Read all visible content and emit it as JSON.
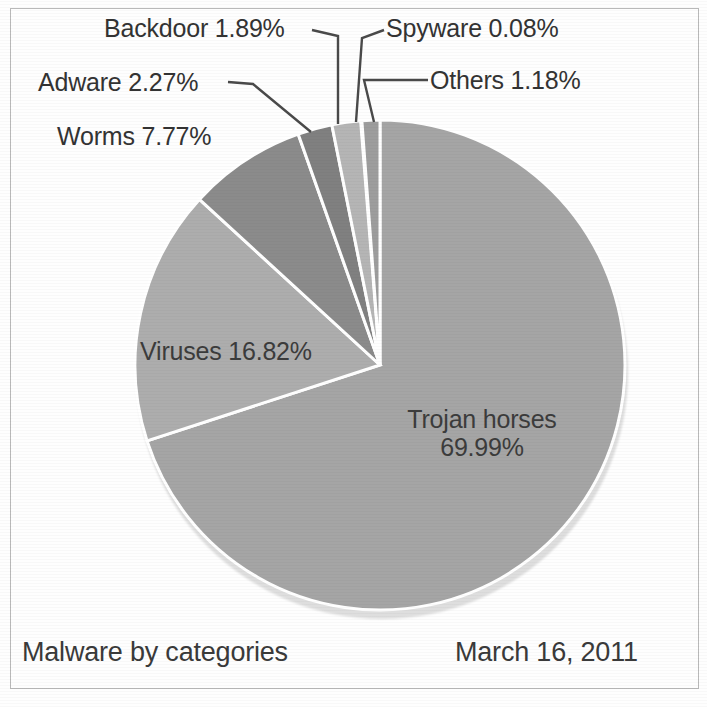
{
  "caption": {
    "title": "Malware by categories",
    "date": "March 16, 2011"
  },
  "chart_data": {
    "type": "pie",
    "title": "Malware by categories",
    "subtitle": "March 16, 2011",
    "units": "percent",
    "total": 100.0,
    "start_angle_deg": 0,
    "direction": "clockwise",
    "legend": "none",
    "labels_inside": [
      "Trojan horses",
      "Viruses"
    ],
    "labels_outside_with_leaders": [
      "Worms",
      "Adware",
      "Backdoor",
      "Spyware",
      "Others"
    ],
    "categories": [
      "Trojan horses",
      "Viruses",
      "Worms",
      "Adware",
      "Backdoor",
      "Spyware",
      "Others"
    ],
    "values": [
      69.99,
      16.82,
      7.77,
      2.27,
      1.89,
      0.08,
      1.18
    ],
    "colors": [
      "#a5a5a5",
      "#adadad",
      "#8b8b8b",
      "#808080",
      "#b5b5b5",
      "#cfcfcf",
      "#9d9d9d"
    ],
    "slices": [
      {
        "name": "Trojan horses",
        "value": 69.99,
        "label": "Trojan horses",
        "percent_label": "69.99%",
        "color": "#a5a5a5"
      },
      {
        "name": "Viruses",
        "value": 16.82,
        "label": "Viruses",
        "percent_label": "16.82%",
        "color": "#adadad"
      },
      {
        "name": "Worms",
        "value": 7.77,
        "label": "Worms",
        "percent_label": "7.77%",
        "color": "#8b8b8b"
      },
      {
        "name": "Adware",
        "value": 2.27,
        "label": "Adware",
        "percent_label": "2.27%",
        "color": "#808080"
      },
      {
        "name": "Backdoor",
        "value": 1.89,
        "label": "Backdoor",
        "percent_label": "1.89%",
        "color": "#b5b5b5"
      },
      {
        "name": "Spyware",
        "value": 0.08,
        "label": "Spyware",
        "percent_label": "0.08%",
        "color": "#cfcfcf"
      },
      {
        "name": "Others",
        "value": 1.18,
        "label": "Others",
        "percent_label": "1.18%",
        "color": "#9d9d9d"
      }
    ]
  },
  "labels": {
    "backdoor": "Backdoor 1.89%",
    "spyware": "Spyware 0.08%",
    "adware": "Adware 2.27%",
    "others": "Others 1.18%",
    "worms": "Worms 7.77%",
    "viruses": "Viruses 16.82%",
    "trojan_name": "Trojan horses",
    "trojan_pct": "69.99%"
  }
}
